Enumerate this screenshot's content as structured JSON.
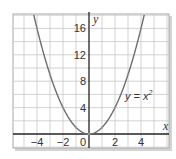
{
  "chart_data": {
    "type": "line",
    "title": "",
    "xlabel": "x",
    "ylabel": "y",
    "xlim": [
      -6,
      6
    ],
    "ylim": [
      -2,
      18
    ],
    "grid": true,
    "x_ticks": [
      -4,
      -2,
      0,
      2,
      4
    ],
    "x_tick_labels": [
      "−4",
      "−2",
      "0",
      "2",
      "4"
    ],
    "y_ticks": [
      4,
      8,
      12,
      16
    ],
    "y_tick_labels": [
      "4",
      "8",
      "12",
      "16"
    ],
    "annotations": [
      {
        "text": "y = x²",
        "x": 3.3,
        "y": 9
      }
    ],
    "series": [
      {
        "name": "y = x²",
        "x": [
          -4.2,
          -4,
          -3,
          -2,
          -1,
          0,
          1,
          2,
          3,
          4,
          4.2
        ],
        "values": [
          17.64,
          16,
          9,
          4,
          1,
          0,
          1,
          4,
          9,
          16,
          17.64
        ],
        "color": "#6e6e6e"
      }
    ],
    "marked_points": [
      [
        -4,
        16
      ],
      [
        -3,
        9
      ],
      [
        -2,
        4
      ],
      [
        -1,
        1
      ],
      [
        0,
        0
      ],
      [
        1,
        1
      ],
      [
        2,
        4
      ],
      [
        3,
        9
      ],
      [
        4,
        16
      ]
    ]
  },
  "labels": {
    "x_axis": "x",
    "y_axis": "y",
    "equation_lhs": "y = x",
    "equation_exp": "2",
    "tick_x": [
      "−4",
      "−2",
      "0",
      "2",
      "4"
    ],
    "tick_y": [
      "4",
      "8",
      "12",
      "16"
    ]
  },
  "colors": {
    "grid": "#c8c8c8",
    "frame": "#a0a0a0",
    "axis": "#222222",
    "curve": "#6e6e6e",
    "shadow": "#d0d0d0"
  }
}
